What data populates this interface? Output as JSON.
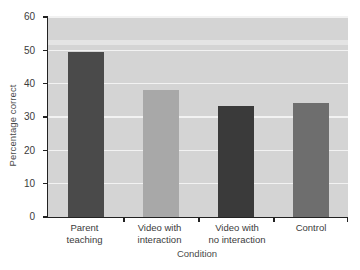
{
  "chart_data": {
    "type": "bar",
    "title": "",
    "subtitle": "",
    "xlabel": "Condition",
    "ylabel": "Percentage correct",
    "categories": [
      "Parent teaching",
      "Video with interaction",
      "Video with no interaction",
      "Control"
    ],
    "category_lines": [
      [
        "Parent",
        "teaching"
      ],
      [
        "Video with",
        "interaction"
      ],
      [
        "Video with",
        "no interaction"
      ],
      [
        "Control",
        ""
      ]
    ],
    "values": [
      49.5,
      38.1,
      33.4,
      34.3
    ],
    "ylim": [
      0,
      60
    ],
    "yticks": [
      0,
      10,
      20,
      30,
      40,
      50,
      60
    ],
    "ytick_labels": [
      "0",
      "10",
      "20",
      "30",
      "40",
      "50",
      "60"
    ],
    "grid": true,
    "grid_color": "#f2f2f2",
    "legend": "none",
    "plot_background": "#d4d4d4",
    "figure_background": "#ffffff",
    "axis_color": "#222222",
    "bar_colors": [
      "#4a4a4a",
      "#a8a8a8",
      "#3a3a3a",
      "#6e6e6e"
    ],
    "bar_width_px": 36,
    "annotations": []
  }
}
